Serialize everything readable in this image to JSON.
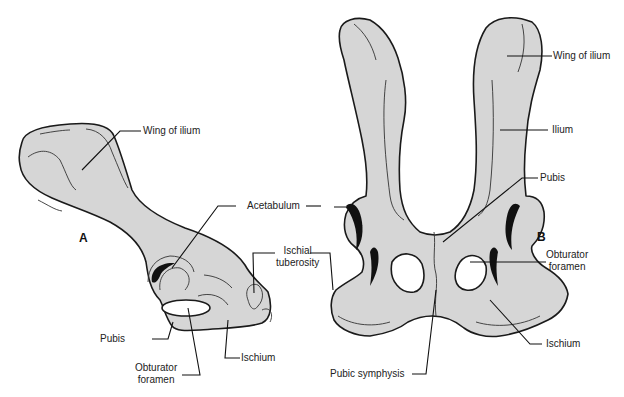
{
  "figure": {
    "panel_a": {
      "letter": "A",
      "view": "lateral",
      "labels": {
        "wing_of_ilium": "Wing of ilium",
        "acetabulum": "Acetabulum",
        "ischial_tuberosity_1": "Ischial",
        "ischial_tuberosity_2": "tuberosity",
        "pubis": "Pubis",
        "obturator_foramen_1": "Obturator",
        "obturator_foramen_2": "foramen",
        "ischium": "Ischium"
      }
    },
    "panel_b": {
      "letter": "B",
      "view": "dorsal",
      "labels": {
        "wing_of_ilium": "Wing of ilium",
        "ilium": "Ilium",
        "pubis": "Pubis",
        "obturator_foramen_1": "Obturator",
        "obturator_foramen_2": "foramen",
        "ischium": "Ischium",
        "pubic_symphysis": "Pubic symphysis"
      }
    },
    "colors": {
      "bone_fill": "#d6d6d6",
      "outline": "#1a1a1a",
      "background": "#ffffff"
    }
  }
}
